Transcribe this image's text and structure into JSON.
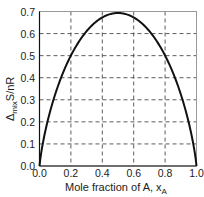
{
  "chart_data": {
    "type": "line",
    "title": "",
    "xlabel": "Mole fraction of A, x_A",
    "xlabel_main": "Mole fraction of A, x",
    "xlabel_sub": "A",
    "ylabel": "Δ_mix S/nR",
    "ylabel_prefix": "Δ",
    "ylabel_sub": "mix",
    "ylabel_suffix": "S/nR",
    "xlim": [
      0,
      1
    ],
    "ylim": [
      0,
      0.7
    ],
    "grid": true,
    "grid_style": "dashed",
    "legend": null,
    "x_ticks": [
      "0.0",
      "0.2",
      "0.4",
      "0.6",
      "0.8",
      "1.0"
    ],
    "y_ticks": [
      "0.0",
      "0.1",
      "0.2",
      "0.3",
      "0.4",
      "0.5",
      "0.6",
      "0.7"
    ],
    "series": [
      {
        "name": "-(xA ln xA + xB ln xB)",
        "x": [
          0.0,
          0.01,
          0.05,
          0.1,
          0.15,
          0.2,
          0.25,
          0.3,
          0.35,
          0.4,
          0.45,
          0.5,
          0.55,
          0.6,
          0.65,
          0.7,
          0.75,
          0.8,
          0.85,
          0.9,
          0.95,
          0.99,
          1.0
        ],
        "values": [
          0.0,
          0.056,
          0.199,
          0.325,
          0.423,
          0.5,
          0.562,
          0.611,
          0.647,
          0.673,
          0.688,
          0.693,
          0.688,
          0.673,
          0.647,
          0.611,
          0.562,
          0.5,
          0.423,
          0.325,
          0.199,
          0.056,
          0.0
        ]
      }
    ]
  },
  "colors": {
    "curve": "#111111",
    "grid": "#333333",
    "axes": "#888888"
  }
}
